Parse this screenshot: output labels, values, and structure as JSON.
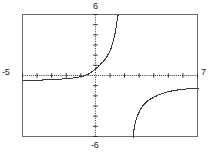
{
  "plot": {
    "labels": {
      "y_max": "6",
      "y_min": "-6",
      "x_min": "-5",
      "x_max": "7"
    }
  },
  "chart_data": {
    "type": "line",
    "title": "",
    "xlabel": "",
    "ylabel": "",
    "xlim": [
      -5,
      7
    ],
    "ylim": [
      -6,
      6
    ],
    "grid": false,
    "legend": null,
    "axis_style": "dotted-crosshair",
    "tick_spacing_x": 1,
    "tick_spacing_y": 1,
    "tick_labels_x": [
      "-5",
      "7"
    ],
    "tick_labels_y": [
      "-6",
      "6"
    ],
    "asymptotes": {
      "vertical": [
        2.5
      ],
      "horizontal": [
        0
      ]
    },
    "series": [
      {
        "name": "branch-left",
        "comment": "Left/lower branch: approaches y = 0 from below on the far left, rises through the origin region and climbs steeply to the top of the window just right of the y-axis.",
        "x": [
          -5.0,
          -4.6,
          -4.2,
          -3.8,
          -3.4,
          -3.0,
          -2.6,
          -2.2,
          -1.8,
          -1.4,
          -1.0,
          -0.6,
          -0.2,
          0.2,
          0.6,
          0.9,
          1.1,
          1.25,
          1.35,
          1.42,
          1.48,
          1.52
        ],
        "y": [
          -0.45,
          -0.44,
          -0.42,
          -0.4,
          -0.38,
          -0.35,
          -0.32,
          -0.28,
          -0.23,
          -0.16,
          -0.05,
          0.15,
          0.5,
          1.0,
          1.6,
          2.3,
          3.0,
          3.8,
          4.5,
          5.2,
          5.7,
          6.0
        ]
      },
      {
        "name": "branch-right",
        "comment": "Right/lower branch: emerges from the bottom of the window at the vertical asymptote and rises toward the horizontal asymptote y = 0 from below.",
        "x": [
          2.55,
          2.6,
          2.7,
          2.85,
          3.05,
          3.3,
          3.6,
          3.95,
          4.3,
          4.7,
          5.1,
          5.5,
          5.9,
          6.3,
          6.7,
          7.0
        ],
        "y": [
          -6.0,
          -5.4,
          -4.6,
          -3.9,
          -3.3,
          -2.8,
          -2.4,
          -2.1,
          -1.85,
          -1.65,
          -1.5,
          -1.4,
          -1.32,
          -1.26,
          -1.22,
          -1.2
        ]
      }
    ]
  }
}
